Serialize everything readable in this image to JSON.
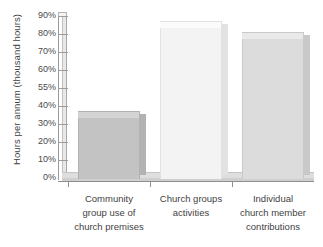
{
  "chart_data": {
    "type": "bar",
    "title": "",
    "subtitle": "",
    "xlabel": "",
    "ylabel": "Hours per annum (thousand hours)",
    "categories": [
      "Community group use of church premises",
      "Church groups activities",
      "Individual church member contributions"
    ],
    "values": [
      37,
      87,
      81
    ],
    "ylim": [
      0,
      90
    ],
    "ytick_labels": [
      "0%",
      "10%",
      "20%",
      "30%",
      "40%",
      "55%",
      "60%",
      "70%",
      "80%",
      "90%"
    ],
    "ytick_values": [
      0,
      10,
      20,
      30,
      40,
      50,
      60,
      70,
      80,
      90
    ],
    "grid": false,
    "legend": "none",
    "series": [
      {
        "name": "Hours per annum",
        "values": [
          37,
          87,
          81
        ]
      }
    ]
  },
  "axis": {
    "y_title": "Hours per annum (thousand hours)",
    "ticks": [
      {
        "label": "90%",
        "value": 90
      },
      {
        "label": "80%",
        "value": 80
      },
      {
        "label": "70%",
        "value": 70
      },
      {
        "label": "60%",
        "value": 60
      },
      {
        "label": "55%",
        "value": 50
      },
      {
        "label": "40%",
        "value": 40
      },
      {
        "label": "30%",
        "value": 30
      },
      {
        "label": "20%",
        "value": 20
      },
      {
        "label": "10%",
        "value": 10
      },
      {
        "label": "0%",
        "value": 0
      }
    ]
  },
  "bars": [
    {
      "id": "community-group-use",
      "value": 37,
      "color": "#c3c3c3",
      "top_color": "#d4d4d4",
      "side_color": "#b2b2b2",
      "label_lines": [
        "Community",
        "group use of",
        "church premises"
      ]
    },
    {
      "id": "church-groups-activities",
      "value": 87,
      "color": "#f3f3f3",
      "top_color": "#fbfbfb",
      "side_color": "#e2e2e2",
      "label_lines": [
        "Church groups",
        "activities"
      ]
    },
    {
      "id": "individual-church-member",
      "value": 81,
      "color": "#dcdcdc",
      "top_color": "#e9e9e9",
      "side_color": "#c9c9c9",
      "label_lines": [
        "Individual",
        "church member",
        "contributions"
      ]
    }
  ]
}
